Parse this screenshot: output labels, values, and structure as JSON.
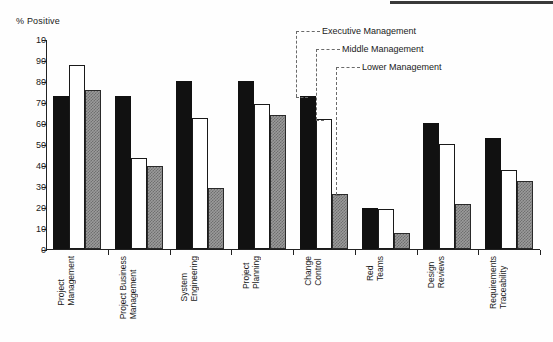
{
  "chart": {
    "y_axis_title": "% Positive",
    "y_ticks": [
      "10",
      "90",
      "80",
      "70",
      "60",
      "50",
      "40",
      "30",
      "20",
      "10",
      "0"
    ],
    "legend": [
      {
        "key": "executive",
        "label": "Executive Management"
      },
      {
        "key": "middle",
        "label": "Middle Management"
      },
      {
        "key": "lower",
        "label": "Lower Management"
      }
    ],
    "categories": [
      "Project\nManagement",
      "Project Business\nManagement",
      "System\nEngineering",
      "Project\nPlanning",
      "Change\nControl",
      "Red\nTeams",
      "Design\nReviews",
      "Requirements\nTraceability"
    ]
  },
  "chart_data": {
    "type": "bar",
    "title": "",
    "subtitle": "",
    "xlabel": "",
    "ylabel": "% Positive",
    "ylim": [
      0,
      100
    ],
    "ytick_values": [
      0,
      10,
      20,
      30,
      40,
      50,
      60,
      70,
      80,
      90,
      100
    ],
    "ytick_labels": [
      "0",
      "10",
      "20",
      "30",
      "40",
      "50",
      "60",
      "70",
      "80",
      "90",
      "10"
    ],
    "grid": false,
    "legend_position": "top-right callout with dotted leader lines to Change Control group",
    "categories": [
      "Project Management",
      "Project Business Management",
      "System Engineering",
      "Project Planning",
      "Change Control",
      "Red Teams",
      "Design Reviews",
      "Requirements Traceability"
    ],
    "series": [
      {
        "name": "Executive Management",
        "style": "solid black",
        "values": [
          73,
          73,
          80,
          80,
          73,
          19.5,
          60,
          53
        ]
      },
      {
        "name": "Middle Management",
        "style": "white with black outline",
        "values": [
          87.5,
          43.5,
          62.5,
          69,
          62,
          19,
          50,
          37.5
        ]
      },
      {
        "name": "Lower Management",
        "style": "gray checkered hatch",
        "values": [
          75.5,
          39.5,
          29,
          64,
          26,
          7.5,
          21.5,
          32.5
        ]
      }
    ]
  }
}
